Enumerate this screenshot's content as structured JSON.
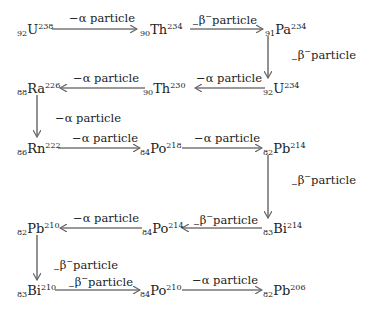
{
  "nodes": [
    {
      "id": "u238",
      "z": "92",
      "sym": "U",
      "a": "238"
    },
    {
      "id": "th234",
      "z": "90",
      "sym": "Th",
      "a": "234"
    },
    {
      "id": "pa234",
      "z": "91",
      "sym": "Pa",
      "a": "234"
    },
    {
      "id": "u234",
      "z": "92",
      "sym": "U",
      "a": "234"
    },
    {
      "id": "th230",
      "z": "90",
      "sym": "Th",
      "a": "230"
    },
    {
      "id": "ra226",
      "z": "88",
      "sym": "Ra",
      "a": "226"
    },
    {
      "id": "rn222",
      "z": "86",
      "sym": "Rn",
      "a": "222"
    },
    {
      "id": "po218",
      "z": "84",
      "sym": "Po",
      "a": "218"
    },
    {
      "id": "pb214",
      "z": "82",
      "sym": "Pb",
      "a": "214"
    },
    {
      "id": "bi214",
      "z": "83",
      "sym": "Bi",
      "a": "214"
    },
    {
      "id": "po214",
      "z": "84",
      "sym": "Po",
      "a": "214"
    },
    {
      "id": "pb210",
      "z": "82",
      "sym": "Pb",
      "a": "210"
    },
    {
      "id": "bi210",
      "z": "83",
      "sym": "Bi",
      "a": "210"
    },
    {
      "id": "po210",
      "z": "84",
      "sym": "Po",
      "a": "210"
    },
    {
      "id": "pb206",
      "z": "82",
      "sym": "Pb",
      "a": "206"
    }
  ],
  "labels": {
    "alpha": {
      "prefix": "−α particle"
    },
    "beta": {
      "pre": "−",
      "greek": "β",
      "sup": "−",
      "text": "particle"
    }
  },
  "edges": [
    {
      "from": "u238",
      "to": "th234",
      "type": "alpha"
    },
    {
      "from": "th234",
      "to": "pa234",
      "type": "beta"
    },
    {
      "from": "pa234",
      "to": "u234",
      "type": "beta"
    },
    {
      "from": "u234",
      "to": "th230",
      "type": "alpha"
    },
    {
      "from": "th230",
      "to": "ra226",
      "type": "alpha"
    },
    {
      "from": "ra226",
      "to": "rn222",
      "type": "alpha"
    },
    {
      "from": "rn222",
      "to": "po218",
      "type": "alpha"
    },
    {
      "from": "po218",
      "to": "pb214",
      "type": "alpha"
    },
    {
      "from": "pb214",
      "to": "bi214",
      "type": "beta"
    },
    {
      "from": "bi214",
      "to": "po214",
      "type": "beta"
    },
    {
      "from": "po214",
      "to": "pb210",
      "type": "alpha"
    },
    {
      "from": "pb210",
      "to": "bi210",
      "type": "beta"
    },
    {
      "from": "bi210",
      "to": "po210",
      "type": "beta"
    },
    {
      "from": "po210",
      "to": "pb206",
      "type": "alpha"
    }
  ]
}
